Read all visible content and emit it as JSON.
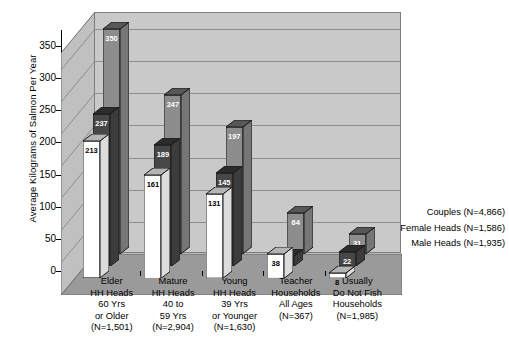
{
  "chart_data": {
    "type": "bar",
    "title": "",
    "subtitle": "",
    "xlabel": "",
    "ylabel": "Average Kilograms of Salmon Per Year",
    "ylim": [
      0,
      375
    ],
    "yticks": [
      0,
      50,
      100,
      150,
      200,
      250,
      300,
      350
    ],
    "grid": true,
    "legend_position": "right-inside",
    "projection": "3d-clustered-columns",
    "categories": [
      "Elder\nHH Heads\n60 Yrs\nor Older\n(N=1,501)",
      "Mature\nHH Heads\n40 to\n59 Yrs\n(N=2,904)",
      "Young\nHH Heads\n39 Yrs\nor Younger\n(N=1,630)",
      "Teacher\nHouseholds\nAll Ages\n(N=367)",
      "Usually\nDo Not Fish\nHouseholds\n(N=1,985)"
    ],
    "category_lines": [
      [
        "Elder",
        "HH Heads",
        "60 Yrs",
        "or Older",
        "(N=1,501)"
      ],
      [
        "Mature",
        "HH Heads",
        "40 to",
        "59 Yrs",
        "(N=2,904)"
      ],
      [
        "Young",
        "HH Heads",
        "39 Yrs",
        "or Younger",
        "(N=1,630)"
      ],
      [
        "Teacher",
        "Households",
        "All Ages",
        "(N=367)"
      ],
      [
        "Usually",
        "Do Not Fish",
        "Households",
        "(N=1,985)"
      ]
    ],
    "series": [
      {
        "name": "Couples (N=4,866)",
        "color": "#8d8d8d",
        "label_color": "#ffffff",
        "values": [
          350,
          247,
          197,
          64,
          31
        ]
      },
      {
        "name": "Female Heads (N=1,586)",
        "color": "#474747",
        "label_color": "#ffffff",
        "values": [
          237,
          189,
          145,
          16,
          22
        ]
      },
      {
        "name": "Male Heads (N=1,935)",
        "color": "#ffffff",
        "label_color": "#000000",
        "values": [
          213,
          161,
          131,
          38,
          8
        ]
      }
    ]
  },
  "legend": {
    "items": [
      "Couples (N=4,866)",
      "Female Heads (N=1,586)",
      "Male Heads (N=1,935)"
    ]
  },
  "axis": {
    "y_title": "Average Kilograms of Salmon Per Year",
    "y_ticks": [
      "350",
      "300",
      "250",
      "200",
      "150",
      "100",
      "50",
      "0"
    ]
  },
  "colors": {
    "back_wall": "#c9c9c9",
    "left_wall": "#c0c0c0",
    "floor": "#9a9a9a",
    "gridline": "#8e8e8e",
    "outline": "#1a1a1a",
    "series_couples": "#8d8d8d",
    "series_female": "#474747",
    "series_male": "#ffffff"
  }
}
